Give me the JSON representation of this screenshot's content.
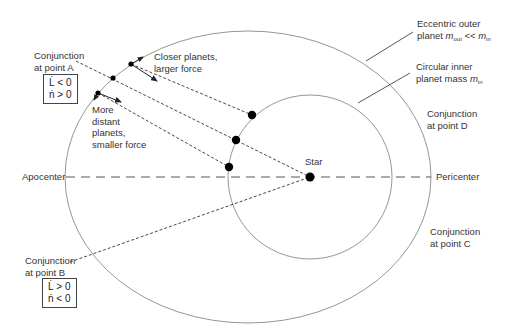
{
  "labels": {
    "conj_a_1": "Conjunction",
    "conj_a_2": "at point A",
    "conj_b_1": "Conjunction",
    "conj_b_2": "at point B",
    "conj_c_1": "Conjunction",
    "conj_c_2": "at point C",
    "conj_d_1": "Conjunction",
    "conj_d_2": "at point D",
    "closer_1": "Closer planets,",
    "closer_2": "larger force",
    "distant_1": "More",
    "distant_2": "distant",
    "distant_3": "planets,",
    "distant_4": "smaller force",
    "outer_1": "Eccentric outer",
    "outer_2_prefix": "planet ",
    "outer_2_m": "m",
    "outer_2_sub1": "out",
    "outer_2_mid": " << ",
    "outer_2_m2": "m",
    "outer_2_sub2": "in",
    "inner_1": "Circular inner",
    "inner_2_prefix": "planet mass ",
    "inner_2_m": "m",
    "inner_2_sub": "in",
    "star": "Star",
    "apocenter": "Apocenter",
    "pericenter": "Pericenter"
  },
  "box_a": {
    "line1": "L̇ < 0",
    "line2": "ṅ > 0"
  },
  "box_b": {
    "line1": "L̇ > 0",
    "line2": "ṅ < 0"
  },
  "colors": {
    "orbit": "#8a8a8a",
    "line": "#333333",
    "body": "#000000"
  }
}
